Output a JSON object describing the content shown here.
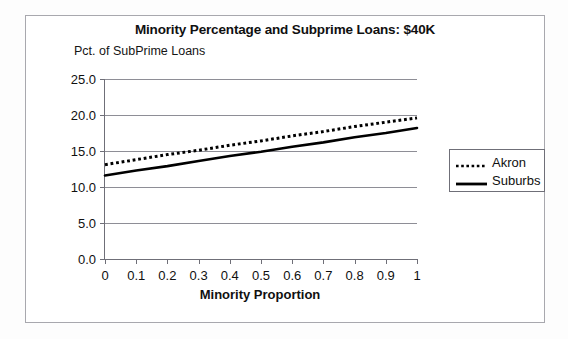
{
  "chart_data": {
    "type": "line",
    "title": "Minority Percentage and Subprime Loans: $40K",
    "subtitle": "Pct. of SubPrime Loans",
    "xlabel": "Minority Proportion",
    "ylabel": "Pct. of SubPrime Loans",
    "grid": true,
    "legend_position": "right",
    "xlim": [
      0,
      1
    ],
    "ylim": [
      0.0,
      25.0
    ],
    "x_tick_labels": [
      "0",
      "0.1",
      "0.2",
      "0.3",
      "0.4",
      "0.5",
      "0.6",
      "0.7",
      "0.8",
      "0.9",
      "1"
    ],
    "x": [
      0,
      0.1,
      0.2,
      0.3,
      0.4,
      0.5,
      0.6,
      0.7,
      0.8,
      0.9,
      1
    ],
    "y_tick_labels": [
      "0.0",
      "5.0",
      "10.0",
      "15.0",
      "20.0",
      "25.0"
    ],
    "y_ticks": [
      0.0,
      5.0,
      10.0,
      15.0,
      20.0,
      25.0
    ],
    "series": [
      {
        "name": "Akron",
        "style": "dotted",
        "color": "#000000",
        "values": [
          13.1,
          13.8,
          14.5,
          15.1,
          15.8,
          16.4,
          17.1,
          17.7,
          18.4,
          19.0,
          19.6
        ]
      },
      {
        "name": "Suburbs",
        "style": "solid",
        "color": "#000000",
        "values": [
          11.6,
          12.3,
          12.9,
          13.6,
          14.3,
          14.9,
          15.6,
          16.2,
          16.9,
          17.5,
          18.2
        ]
      }
    ]
  },
  "legend": {
    "entries": [
      {
        "label": "Akron",
        "style": "dotted"
      },
      {
        "label": "Suburbs",
        "style": "solid"
      }
    ]
  }
}
